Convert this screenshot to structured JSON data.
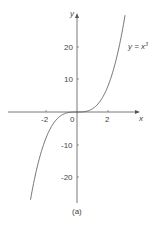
{
  "chart_data": {
    "type": "line",
    "title": "",
    "caption": "(a)",
    "xlabel": "x",
    "ylabel": "y",
    "series": [
      {
        "name": "y = x³",
        "label": "y = x³",
        "function": "x^3",
        "x": [
          -3.4,
          -3,
          -2.5,
          -2,
          -1.5,
          -1,
          -0.5,
          0,
          0.5,
          1,
          1.5,
          2,
          2.5,
          3,
          3.4
        ],
        "values": [
          -39.3,
          -27,
          -15.6,
          -8,
          -3.4,
          -1,
          -0.1,
          0,
          0.1,
          1,
          3.4,
          8,
          15.6,
          27,
          39.3
        ]
      }
    ],
    "xticks": [
      "-2",
      "0",
      "2"
    ],
    "yticks": [
      "20",
      "10",
      "-10",
      "-20"
    ],
    "xlim": [
      -4.4,
      4
    ],
    "ylim": [
      -28,
      30
    ],
    "grid": false,
    "legend": "inline label"
  },
  "labels": {
    "x_axis": "x",
    "y_axis": "y",
    "curve": "y = x",
    "curve_sup": "3",
    "caption": "(a)",
    "ticks": {
      "xm2": "-2",
      "x0": "0",
      "x2": "2",
      "y20": "20",
      "y10": "10",
      "ym10": "-10",
      "ym20": "-20"
    }
  }
}
